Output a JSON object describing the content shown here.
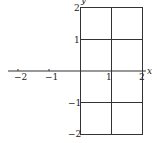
{
  "diagram": {
    "type": "coordinate-grid",
    "x_axis": {
      "label": "x",
      "ticks": [
        {
          "v": -2,
          "label": "−2"
        },
        {
          "v": -1,
          "label": "−1"
        },
        {
          "v": 1,
          "label": "1"
        },
        {
          "v": 2,
          "label": "2"
        }
      ]
    },
    "y_axis": {
      "label": "y",
      "ticks": [
        {
          "v": 2,
          "label": "2"
        },
        {
          "v": 1,
          "label": "1"
        },
        {
          "v": -1,
          "label": "−1"
        },
        {
          "v": -2,
          "label": "−2"
        }
      ]
    },
    "grid_region": {
      "x_min": 0,
      "x_max": 2,
      "y_min": -2,
      "y_max": 2,
      "step": 1
    },
    "line_color": "#333333"
  }
}
